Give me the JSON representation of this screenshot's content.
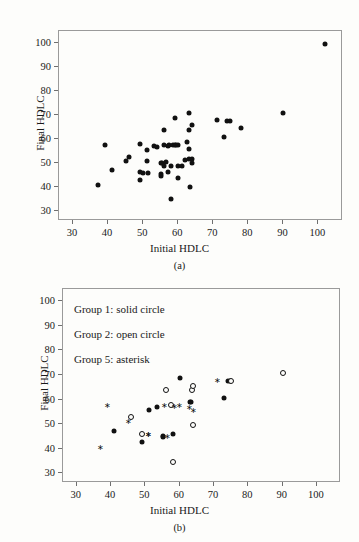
{
  "figure": {
    "background": "#fdfdfb",
    "marker_color": "#111111",
    "frame_color": "#9a9a9a"
  },
  "panels": [
    {
      "id": "a",
      "caption": "(a)",
      "chart_data": {
        "type": "scatter",
        "title": "",
        "xlabel": "Initial HDLC",
        "ylabel": "Final HDLC",
        "xlim": [
          26,
          107
        ],
        "ylim": [
          26,
          105
        ],
        "xticks": [
          30,
          40,
          50,
          60,
          70,
          80,
          90,
          100
        ],
        "yticks": [
          30,
          40,
          50,
          60,
          70,
          80,
          90,
          100
        ],
        "grid": false,
        "legend": "none",
        "series": [
          {
            "name": "All subjects",
            "marker": "solid-circle",
            "points": [
              [
                37,
                41
              ],
              [
                39,
                57.8
              ],
              [
                41,
                47
              ],
              [
                45,
                51
              ],
              [
                46,
                52.8
              ],
              [
                49,
                58
              ],
              [
                49,
                46.3
              ],
              [
                49,
                43
              ],
              [
                50,
                46
              ],
              [
                51,
                50.8
              ],
              [
                51,
                55.6
              ],
              [
                51.5,
                46
              ],
              [
                53,
                57
              ],
              [
                54,
                56.8
              ],
              [
                55,
                50
              ],
              [
                55,
                45.5
              ],
              [
                55,
                44.8
              ],
              [
                55.5,
                50.3
              ],
              [
                56,
                57.8
              ],
              [
                56,
                63.8
              ],
              [
                56,
                49
              ],
              [
                56.5,
                50.5
              ],
              [
                57,
                46.2
              ],
              [
                57,
                57.3
              ],
              [
                57.5,
                57.5
              ],
              [
                58,
                35
              ],
              [
                58,
                48.8
              ],
              [
                58.5,
                57.6
              ],
              [
                59,
                57.5
              ],
              [
                59,
                68.8
              ],
              [
                59.5,
                57.5
              ],
              [
                60,
                57.6
              ],
              [
                60,
                49
              ],
              [
                60,
                43.8
              ],
              [
                61,
                48.7
              ],
              [
                62,
                51.5
              ],
              [
                62.5,
                59
              ],
              [
                63,
                70.8
              ],
              [
                63,
                64
              ],
              [
                63,
                56
              ],
              [
                63,
                51.8
              ],
              [
                63.5,
                40
              ],
              [
                64,
                65.8
              ],
              [
                64,
                51.8
              ],
              [
                64,
                50.2
              ],
              [
                71,
                67.8
              ],
              [
                73,
                60.8
              ],
              [
                74,
                67.7
              ],
              [
                74.8,
                67.7
              ],
              [
                78,
                64.6
              ],
              [
                90,
                70.7
              ],
              [
                102,
                99.5
              ]
            ]
          }
        ]
      }
    },
    {
      "id": "b",
      "caption": "(b)",
      "legend_lines": [
        "Group 1: solid circle",
        "Group 2: open circle",
        "Group 5: asterisk"
      ],
      "chart_data": {
        "type": "scatter",
        "title": "",
        "xlabel": "Initial HDLC",
        "ylabel": "Final HDLC",
        "xlim": [
          26,
          107
        ],
        "ylim": [
          26,
          105
        ],
        "xticks": [
          30,
          40,
          50,
          60,
          70,
          80,
          90,
          100
        ],
        "yticks": [
          30,
          40,
          50,
          60,
          70,
          80,
          90,
          100
        ],
        "grid": false,
        "legend": "in-plot-text",
        "series": [
          {
            "name": "Group 1",
            "marker": "solid-circle",
            "points": [
              [
                41,
                47
              ],
              [
                49,
                42.8
              ],
              [
                51,
                55.7
              ],
              [
                53.5,
                56.8
              ],
              [
                55,
                45
              ],
              [
                55,
                44.6
              ],
              [
                58,
                45.8
              ],
              [
                60,
                68.8
              ],
              [
                63,
                58.8
              ],
              [
                63.2,
                58.9
              ],
              [
                73,
                60.7
              ],
              [
                74,
                67.7
              ],
              [
                74.6,
                67.7
              ]
            ]
          },
          {
            "name": "Group 2",
            "marker": "open-circle",
            "points": [
              [
                45.8,
                52.8
              ],
              [
                49,
                46
              ],
              [
                56,
                63.8
              ],
              [
                57.5,
                57.8
              ],
              [
                58,
                34.6
              ],
              [
                63.5,
                64
              ],
              [
                64,
                65.6
              ],
              [
                64,
                49.8
              ],
              [
                75,
                67.7
              ],
              [
                90,
                70.6
              ]
            ]
          },
          {
            "name": "Group 5",
            "marker": "asterisk",
            "points": [
              [
                37,
                40.8
              ],
              [
                39,
                57.8
              ],
              [
                45,
                51.2
              ],
              [
                50.8,
                46
              ],
              [
                51,
                46
              ],
              [
                55.5,
                57.7
              ],
              [
                58.5,
                57.2
              ],
              [
                59.8,
                57.8
              ],
              [
                62.8,
                56.8
              ],
              [
                64,
                55.6
              ],
              [
                56.5,
                45.3
              ],
              [
                71,
                67.8
              ]
            ]
          }
        ]
      }
    }
  ]
}
